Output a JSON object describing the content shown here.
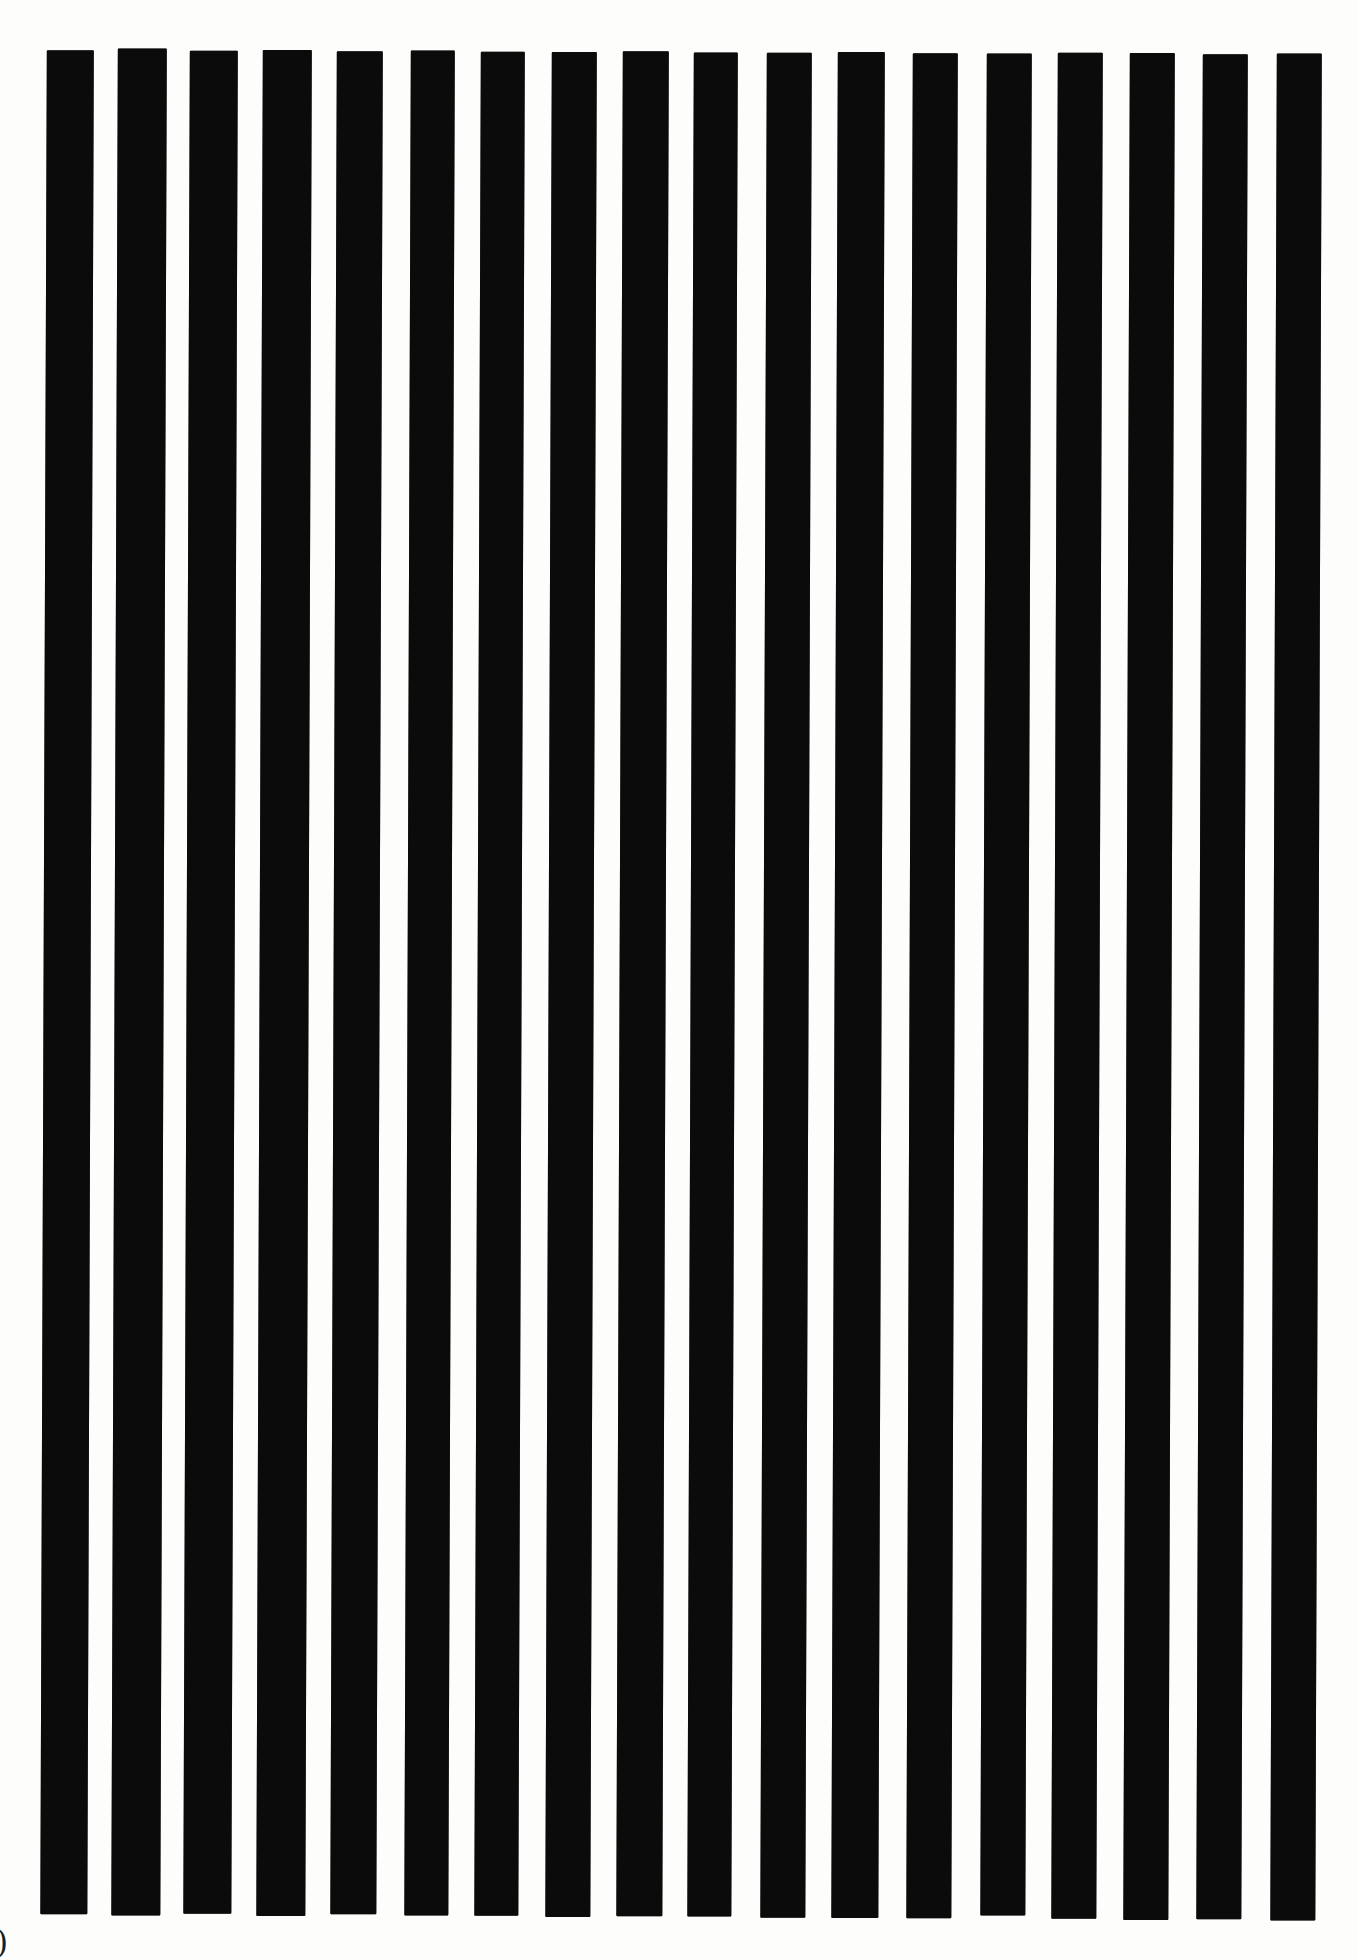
{
  "page": {
    "background_color": "#fdfdfc",
    "corner_glyph": ")"
  },
  "artwork": {
    "type": "vertical-stripes",
    "stripe_color": "#0b0b0b",
    "stripe_count": 18,
    "lean_deg": 0.2,
    "bars": [
      {
        "x": 47,
        "width": 47,
        "top": 50,
        "bottom": 1914
      },
      {
        "x": 118,
        "width": 49,
        "top": 48,
        "bottom": 1915
      },
      {
        "x": 190,
        "width": 48,
        "top": 50,
        "bottom": 1913
      },
      {
        "x": 263,
        "width": 49,
        "top": 49,
        "bottom": 1915
      },
      {
        "x": 337,
        "width": 46,
        "top": 50,
        "bottom": 1913
      },
      {
        "x": 411,
        "width": 44,
        "top": 49,
        "bottom": 1914
      },
      {
        "x": 481,
        "width": 44,
        "top": 50,
        "bottom": 1914
      },
      {
        "x": 552,
        "width": 45,
        "top": 50,
        "bottom": 1915
      },
      {
        "x": 623,
        "width": 46,
        "top": 49,
        "bottom": 1914
      },
      {
        "x": 694,
        "width": 44,
        "top": 50,
        "bottom": 1914
      },
      {
        "x": 767,
        "width": 45,
        "top": 50,
        "bottom": 1915
      },
      {
        "x": 838,
        "width": 47,
        "top": 49,
        "bottom": 1915
      },
      {
        "x": 913,
        "width": 45,
        "top": 50,
        "bottom": 1915
      },
      {
        "x": 987,
        "width": 45,
        "top": 50,
        "bottom": 1912
      },
      {
        "x": 1058,
        "width": 45,
        "top": 49,
        "bottom": 1915
      },
      {
        "x": 1130,
        "width": 45,
        "top": 49,
        "bottom": 1916
      },
      {
        "x": 1203,
        "width": 45,
        "top": 50,
        "bottom": 1915
      },
      {
        "x": 1277,
        "width": 45,
        "top": 49,
        "bottom": 1916
      }
    ]
  }
}
